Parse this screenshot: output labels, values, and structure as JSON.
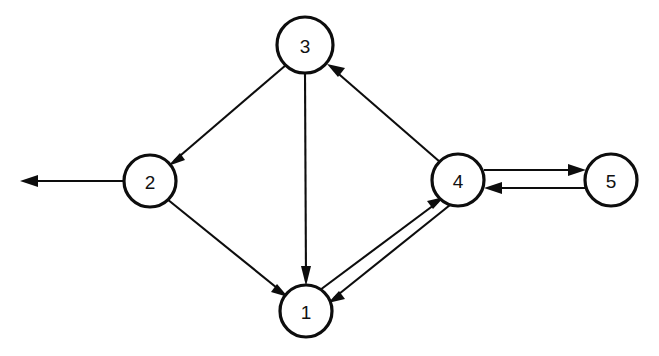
{
  "diagram": {
    "type": "directed-graph",
    "canvas": {
      "width": 659,
      "height": 356,
      "background": "#ffffff"
    },
    "style": {
      "node_fill": "#ffffff",
      "node_stroke": "#0d0d0d",
      "node_stroke_width": 3.2,
      "edge_stroke": "#0d0d0d",
      "edge_stroke_width": 2.1,
      "label_color": "#111111",
      "label_font_size": 19
    },
    "nodes": [
      {
        "id": "3",
        "label": "3",
        "cx": 305,
        "cy": 45,
        "r": 28
      },
      {
        "id": "2",
        "label": "2",
        "cx": 150,
        "cy": 181,
        "r": 26
      },
      {
        "id": "4",
        "label": "4",
        "cx": 458,
        "cy": 180,
        "r": 26
      },
      {
        "id": "5",
        "label": "5",
        "cx": 611,
        "cy": 180,
        "r": 26
      },
      {
        "id": "1",
        "label": "1",
        "cx": 306,
        "cy": 311,
        "r": 26
      }
    ],
    "edges": [
      {
        "id": "e-3-2",
        "from": "3",
        "to": "2",
        "label": "3 to 2",
        "kind": "straight",
        "directed": true
      },
      {
        "id": "e-3-1",
        "from": "3",
        "to": "1",
        "label": "3 to 1",
        "kind": "straight",
        "directed": true
      },
      {
        "id": "e-4-3",
        "from": "4",
        "to": "3",
        "label": "4 to 3",
        "kind": "straight",
        "directed": true
      },
      {
        "id": "e-2-1",
        "from": "2",
        "to": "1",
        "label": "2 to 1",
        "kind": "straight",
        "directed": true
      },
      {
        "id": "e-1-4",
        "from": "1",
        "to": "4",
        "label": "1 to 4",
        "kind": "parallel",
        "directed": true
      },
      {
        "id": "e-4-1",
        "from": "4",
        "to": "1",
        "label": "4 to 1",
        "kind": "parallel",
        "directed": true
      },
      {
        "id": "e-4-5",
        "from": "4",
        "to": "5",
        "label": "4 to 5",
        "kind": "parallel",
        "directed": true
      },
      {
        "id": "e-5-4",
        "from": "5",
        "to": "4",
        "label": "5 to 4",
        "kind": "parallel",
        "directed": true
      },
      {
        "id": "e-2-out",
        "from": "2",
        "to": "external",
        "label": "2 to outside",
        "kind": "dangling",
        "directed": true
      }
    ],
    "geometry": {
      "e_3_2": {
        "x1": 286,
        "y1": 65,
        "x2": 168,
        "y2": 166,
        "angle_deg": 139.4
      },
      "e_3_1": {
        "x1": 305,
        "y1": 73,
        "x2": 306,
        "y2": 285,
        "angle_deg": 89.7
      },
      "e_4_3": {
        "x1": 440,
        "y1": 162,
        "x2": 327,
        "y2": 64,
        "angle_deg": 220.9
      },
      "e_2_1": {
        "x1": 167,
        "y1": 199,
        "x2": 288,
        "y2": 297,
        "angle_deg": 39.0
      },
      "e_1_4": {
        "x1": 320,
        "y1": 290,
        "x2": 444,
        "y2": 197,
        "angle_deg": -36.9
      },
      "e_4_1": {
        "x1": 450,
        "y1": 205,
        "x2": 328,
        "y2": 303,
        "angle_deg": 141.3
      },
      "e_4_5": {
        "x1": 484,
        "y1": 170,
        "x2": 586,
        "y2": 170,
        "angle_deg": 0
      },
      "e_5_4": {
        "x1": 586,
        "y1": 188,
        "x2": 484,
        "y2": 188,
        "angle_deg": 180
      },
      "e_2_out": {
        "x1": 124,
        "y1": 181,
        "x2": 20,
        "y2": 181,
        "angle_deg": 180
      }
    },
    "adjacency_summary": {
      "1": [
        "4"
      ],
      "2": [
        "1",
        "external"
      ],
      "3": [
        "2",
        "1"
      ],
      "4": [
        "3",
        "1",
        "5"
      ],
      "5": [
        "4"
      ]
    }
  }
}
